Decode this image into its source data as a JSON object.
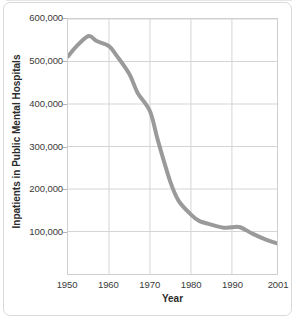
{
  "chart_data": {
    "type": "line",
    "title": "",
    "xlabel": "Year",
    "ylabel": "Inpatients in Public Mental Hospitals",
    "xlim": [
      1950,
      2001
    ],
    "ylim": [
      0,
      600000
    ],
    "grid": true,
    "legend": "none",
    "line_color": "#9a9a9a",
    "gridline_color": "#d5d5d5",
    "axis_color": "#cfcfcf",
    "x_ticks": [
      1950,
      1960,
      1970,
      1980,
      1990,
      2001
    ],
    "x_tick_labels": [
      "1950",
      "1960",
      "1970",
      "1980",
      "1990",
      "2001"
    ],
    "y_ticks": [
      100000,
      200000,
      300000,
      400000,
      500000,
      600000
    ],
    "y_tick_labels": [
      "100,000",
      "200,000",
      "300,000",
      "400,000",
      "500,000",
      "600,000"
    ],
    "series": [
      {
        "name": "Inpatients in Public Mental Hospitals",
        "x": [
          1950,
          1952,
          1955,
          1957,
          1960,
          1962,
          1965,
          1967,
          1970,
          1972,
          1975,
          1977,
          1980,
          1982,
          1985,
          1988,
          1990,
          1992,
          1995,
          1998,
          2001
        ],
        "values": [
          512000,
          535000,
          560000,
          548000,
          536000,
          512000,
          470000,
          426000,
          383000,
          312000,
          216000,
          172000,
          140000,
          125000,
          116000,
          109000,
          110000,
          110000,
          95000,
          82000,
          72000
        ]
      }
    ]
  }
}
